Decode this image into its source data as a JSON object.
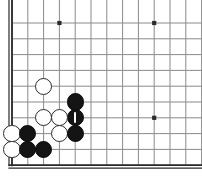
{
  "diagram": {
    "kind": "go-board-diagram",
    "board_size": 19,
    "view": {
      "width": 202,
      "height": 184,
      "origin_x": 12,
      "origin_y": 23,
      "grid_spacing": 15.8,
      "cols_visible": 13,
      "rows_visible": 10,
      "edges": {
        "left": true,
        "bottom": true,
        "top": false,
        "right": false
      }
    },
    "colors": {
      "background": "#ffffff",
      "grid_line": "#8a8a8a",
      "border_line": "#2b2b2b",
      "black_stone": "#141414",
      "white_stone": "#ffffff",
      "white_stone_outline": "#2a2a2a",
      "marker": "#ffffff"
    },
    "stone_radius": 8.6,
    "star_points": [
      {
        "col": 3,
        "row": 0
      },
      {
        "col": 9,
        "row": 0
      },
      {
        "col": 9,
        "row": 6
      }
    ],
    "stones": [
      {
        "id": "w1",
        "color": "white",
        "col": 2,
        "row": 4,
        "marked": false
      },
      {
        "id": "b1",
        "color": "black",
        "col": 4,
        "row": 5,
        "marked": false
      },
      {
        "id": "b2",
        "color": "black",
        "col": 4,
        "row": 6,
        "marked": true,
        "marker": "vertical-line"
      },
      {
        "id": "w2",
        "color": "white",
        "col": 2,
        "row": 6,
        "marked": false
      },
      {
        "id": "w3",
        "color": "white",
        "col": 3,
        "row": 6,
        "marked": false
      },
      {
        "id": "w4",
        "color": "white",
        "col": 0,
        "row": 7,
        "marked": false
      },
      {
        "id": "b3",
        "color": "black",
        "col": 1,
        "row": 7,
        "marked": false
      },
      {
        "id": "w5",
        "color": "white",
        "col": 3,
        "row": 7,
        "marked": false
      },
      {
        "id": "b4",
        "color": "black",
        "col": 4,
        "row": 7,
        "marked": false
      },
      {
        "id": "w6",
        "color": "white",
        "col": 0,
        "row": 8,
        "marked": false
      },
      {
        "id": "b5",
        "color": "black",
        "col": 1,
        "row": 8,
        "marked": false
      },
      {
        "id": "b6",
        "color": "black",
        "col": 2,
        "row": 8,
        "marked": false
      }
    ]
  }
}
